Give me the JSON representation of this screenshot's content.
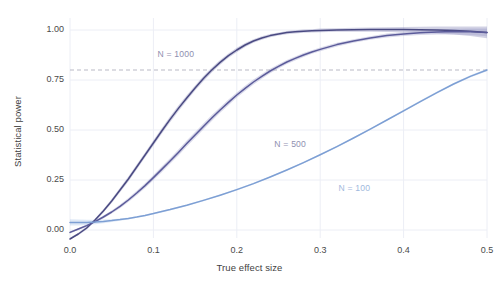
{
  "chart_data": {
    "type": "line",
    "title": "",
    "xlabel": "True effect size",
    "ylabel": "Statistical power",
    "xlim": [
      0.0,
      0.5
    ],
    "ylim": [
      -0.04,
      1.06
    ],
    "xticks": [
      "0.0",
      "0.1",
      "0.2",
      "0.3",
      "0.4",
      "0.5"
    ],
    "xtick_values": [
      0.0,
      0.1,
      0.2,
      0.3,
      0.4,
      0.5
    ],
    "yticks": [
      "0.00",
      "0.25",
      "0.50",
      "0.75",
      "1.00"
    ],
    "ytick_values": [
      0.0,
      0.25,
      0.5,
      0.75,
      1.0
    ],
    "grid": true,
    "legend_position": "inline-annotations",
    "reference_line": {
      "name": "power-threshold",
      "y": 0.8,
      "style": "dashed",
      "color": "#b9b9c6"
    },
    "series": [
      {
        "name": "N = 1000",
        "color": "#4a4a82",
        "band_color": "#8a8ab8",
        "label": "N = 1000",
        "label_x": 0.105,
        "label_y": 0.875,
        "x": [
          0.0,
          0.01,
          0.02,
          0.025,
          0.03,
          0.04,
          0.05,
          0.06,
          0.07,
          0.08,
          0.09,
          0.1,
          0.11,
          0.12,
          0.13,
          0.14,
          0.15,
          0.16,
          0.17,
          0.18,
          0.19,
          0.2,
          0.21,
          0.22,
          0.23,
          0.24,
          0.25,
          0.26,
          0.27,
          0.28,
          0.29,
          0.3,
          0.32,
          0.34,
          0.36,
          0.38,
          0.4,
          0.42,
          0.44,
          0.46,
          0.48,
          0.5
        ],
        "y": [
          -0.045,
          -0.02,
          0.01,
          0.03,
          0.05,
          0.095,
          0.145,
          0.2,
          0.255,
          0.315,
          0.375,
          0.435,
          0.495,
          0.553,
          0.608,
          0.66,
          0.71,
          0.757,
          0.8,
          0.838,
          0.872,
          0.9,
          0.925,
          0.945,
          0.96,
          0.972,
          0.98,
          0.987,
          0.991,
          0.994,
          0.996,
          0.998,
          1.0,
          1.001,
          1.002,
          1.002,
          1.002,
          1.001,
          1.0,
          0.998,
          0.994,
          0.988
        ],
        "band_half_width": [
          0.006,
          0.006,
          0.007,
          0.007,
          0.008,
          0.009,
          0.01,
          0.011,
          0.012,
          0.013,
          0.013,
          0.014,
          0.014,
          0.014,
          0.014,
          0.014,
          0.013,
          0.013,
          0.012,
          0.012,
          0.011,
          0.011,
          0.01,
          0.009,
          0.009,
          0.008,
          0.008,
          0.008,
          0.008,
          0.008,
          0.008,
          0.009,
          0.009,
          0.01,
          0.011,
          0.012,
          0.013,
          0.015,
          0.017,
          0.02,
          0.024,
          0.029
        ]
      },
      {
        "name": "N = 500",
        "color": "#5b5b9a",
        "band_color": "#9a9ac8",
        "label": "N = 500",
        "label_x": 0.245,
        "label_y": 0.425,
        "x": [
          0.0,
          0.01,
          0.02,
          0.025,
          0.03,
          0.04,
          0.05,
          0.06,
          0.07,
          0.08,
          0.09,
          0.1,
          0.11,
          0.12,
          0.13,
          0.14,
          0.15,
          0.16,
          0.17,
          0.18,
          0.19,
          0.2,
          0.21,
          0.22,
          0.23,
          0.24,
          0.25,
          0.26,
          0.27,
          0.28,
          0.29,
          0.3,
          0.32,
          0.34,
          0.36,
          0.38,
          0.4,
          0.42,
          0.44,
          0.46,
          0.48,
          0.5
        ],
        "y": [
          -0.012,
          0.005,
          0.022,
          0.032,
          0.042,
          0.065,
          0.09,
          0.118,
          0.15,
          0.185,
          0.222,
          0.262,
          0.303,
          0.345,
          0.388,
          0.432,
          0.475,
          0.518,
          0.56,
          0.6,
          0.638,
          0.675,
          0.708,
          0.74,
          0.768,
          0.795,
          0.818,
          0.84,
          0.858,
          0.875,
          0.89,
          0.903,
          0.927,
          0.945,
          0.96,
          0.972,
          0.98,
          0.986,
          0.99,
          0.992,
          0.991,
          0.988
        ],
        "band_half_width": [
          0.005,
          0.005,
          0.006,
          0.006,
          0.006,
          0.007,
          0.008,
          0.009,
          0.01,
          0.011,
          0.012,
          0.013,
          0.014,
          0.014,
          0.015,
          0.015,
          0.015,
          0.015,
          0.015,
          0.014,
          0.014,
          0.013,
          0.013,
          0.012,
          0.012,
          0.011,
          0.011,
          0.01,
          0.01,
          0.01,
          0.009,
          0.009,
          0.009,
          0.009,
          0.009,
          0.01,
          0.01,
          0.011,
          0.012,
          0.014,
          0.016,
          0.019
        ]
      },
      {
        "name": "N = 100",
        "color": "#7d9fd4",
        "band_color": "#aac4e8",
        "label": "N = 100",
        "label_x": 0.322,
        "label_y": 0.205,
        "x": [
          0.0,
          0.01,
          0.02,
          0.025,
          0.03,
          0.04,
          0.05,
          0.06,
          0.07,
          0.08,
          0.09,
          0.1,
          0.12,
          0.14,
          0.16,
          0.18,
          0.2,
          0.22,
          0.24,
          0.26,
          0.28,
          0.3,
          0.32,
          0.34,
          0.36,
          0.38,
          0.4,
          0.42,
          0.44,
          0.46,
          0.48,
          0.5
        ],
        "y": [
          0.038,
          0.038,
          0.038,
          0.039,
          0.04,
          0.043,
          0.047,
          0.052,
          0.058,
          0.065,
          0.073,
          0.082,
          0.102,
          0.124,
          0.148,
          0.174,
          0.202,
          0.232,
          0.265,
          0.3,
          0.337,
          0.376,
          0.417,
          0.46,
          0.504,
          0.55,
          0.596,
          0.642,
          0.687,
          0.73,
          0.768,
          0.8
        ],
        "band_half_width": [
          0.016,
          0.015,
          0.013,
          0.012,
          0.011,
          0.009,
          0.007,
          0.006,
          0.005,
          0.004,
          0.004,
          0.004,
          0.004,
          0.004,
          0.004,
          0.004,
          0.004,
          0.004,
          0.004,
          0.004,
          0.004,
          0.004,
          0.004,
          0.004,
          0.004,
          0.004,
          0.005,
          0.005,
          0.005,
          0.005,
          0.006,
          0.006
        ]
      }
    ]
  },
  "style": {
    "grid_color": "#eceef5",
    "axis_text_color": "#4a4a4a",
    "background": "#ffffff"
  }
}
